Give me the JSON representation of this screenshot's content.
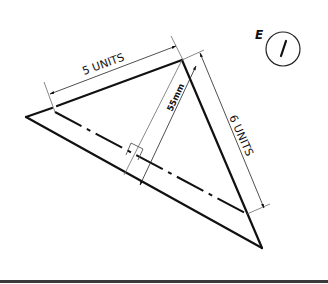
{
  "diagram": {
    "sheet_label": "E",
    "sheet_number": "/",
    "dimensions": {
      "top_edge": {
        "value": "5",
        "unit": "UNITS"
      },
      "right_edge": {
        "value": "6",
        "unit": "UNITS"
      },
      "height": {
        "value": "55",
        "unit": "mm"
      }
    }
  },
  "labels": {
    "top_edge_text": "5 UNITS",
    "right_edge_text": "6 UNITS",
    "height_text": "55mm",
    "sheet_letter": "E",
    "sheet_mark": "/"
  },
  "colors": {
    "line": "#111111",
    "thin_line": "#6a6a6a",
    "background": "#ffffff"
  }
}
